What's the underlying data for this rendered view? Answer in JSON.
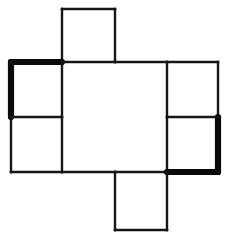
{
  "figure": {
    "background_color": "#ffffff",
    "thin_stick_color": "#161616",
    "bold_stick_color": "#0a0a0a",
    "thin_stick_width": 2.4,
    "bold_stick_width": 6.2,
    "canvas": {
      "width": 234,
      "height": 247
    },
    "grid": {
      "vertical_lines_x": [
        11,
        62,
        115,
        167,
        218
      ],
      "horizontal_lines_y": [
        9,
        62,
        117,
        172,
        230
      ]
    },
    "counts": {
      "total_sticks": 22,
      "bold_sticks": 4,
      "thin_sticks": 18,
      "squares": 6
    },
    "squares": [
      {
        "name": "top-square",
        "x1": 62,
        "y1": 9,
        "x2": 115,
        "y2": 62
      },
      {
        "name": "left-upper-square",
        "x1": 11,
        "y1": 62,
        "x2": 62,
        "y2": 117
      },
      {
        "name": "left-lower-square",
        "x1": 11,
        "y1": 117,
        "x2": 62,
        "y2": 172
      },
      {
        "name": "center-large-square",
        "x1": 62,
        "y1": 62,
        "x2": 167,
        "y2": 172
      },
      {
        "name": "right-upper-square",
        "x1": 167,
        "y1": 62,
        "x2": 218,
        "y2": 117
      },
      {
        "name": "right-lower-square",
        "x1": 167,
        "y1": 117,
        "x2": 218,
        "y2": 172
      },
      {
        "name": "bottom-square",
        "x1": 115,
        "y1": 172,
        "x2": 167,
        "y2": 230
      }
    ],
    "sticks": [
      {
        "name": "top-square-top-edge",
        "weight": "thin",
        "x1": 62,
        "y1": 9,
        "x2": 115,
        "y2": 9
      },
      {
        "name": "top-square-left-edge",
        "weight": "thin",
        "x1": 62,
        "y1": 9,
        "x2": 62,
        "y2": 62
      },
      {
        "name": "top-square-right-edge",
        "weight": "thin",
        "x1": 115,
        "y1": 9,
        "x2": 115,
        "y2": 62
      },
      {
        "name": "left-upper-square-top-edge",
        "weight": "bold",
        "x1": 11,
        "y1": 62,
        "x2": 62,
        "y2": 62
      },
      {
        "name": "left-upper-square-left-edge",
        "weight": "bold",
        "x1": 11,
        "y1": 62,
        "x2": 11,
        "y2": 117
      },
      {
        "name": "left-upper-square-bottom-edge",
        "weight": "thin",
        "x1": 11,
        "y1": 117,
        "x2": 62,
        "y2": 117
      },
      {
        "name": "left-lower-square-left-edge",
        "weight": "thin",
        "x1": 11,
        "y1": 117,
        "x2": 11,
        "y2": 172
      },
      {
        "name": "left-lower-square-bottom-edge",
        "weight": "thin",
        "x1": 11,
        "y1": 172,
        "x2": 62,
        "y2": 172
      },
      {
        "name": "center-square-left-edge-upper",
        "weight": "thin",
        "x1": 62,
        "y1": 62,
        "x2": 62,
        "y2": 117
      },
      {
        "name": "center-square-left-edge-lower",
        "weight": "thin",
        "x1": 62,
        "y1": 117,
        "x2": 62,
        "y2": 172
      },
      {
        "name": "center-square-top-edge-left",
        "weight": "thin",
        "x1": 62,
        "y1": 62,
        "x2": 115,
        "y2": 62
      },
      {
        "name": "center-square-top-edge-right",
        "weight": "thin",
        "x1": 115,
        "y1": 62,
        "x2": 167,
        "y2": 62
      },
      {
        "name": "center-square-bottom-edge-left",
        "weight": "thin",
        "x1": 62,
        "y1": 172,
        "x2": 115,
        "y2": 172
      },
      {
        "name": "center-square-bottom-edge-right",
        "weight": "thin",
        "x1": 115,
        "y1": 172,
        "x2": 167,
        "y2": 172
      },
      {
        "name": "center-square-right-edge-upper",
        "weight": "thin",
        "x1": 167,
        "y1": 62,
        "x2": 167,
        "y2": 117
      },
      {
        "name": "center-square-right-edge-lower",
        "weight": "thin",
        "x1": 167,
        "y1": 117,
        "x2": 167,
        "y2": 172
      },
      {
        "name": "right-upper-square-top-edge",
        "weight": "thin",
        "x1": 167,
        "y1": 62,
        "x2": 218,
        "y2": 62
      },
      {
        "name": "right-upper-square-right-edge",
        "weight": "thin",
        "x1": 218,
        "y1": 62,
        "x2": 218,
        "y2": 117
      },
      {
        "name": "right-lower-square-top-edge",
        "weight": "thin",
        "x1": 167,
        "y1": 117,
        "x2": 218,
        "y2": 117
      },
      {
        "name": "right-lower-square-right-edge",
        "weight": "bold",
        "x1": 218,
        "y1": 117,
        "x2": 218,
        "y2": 172
      },
      {
        "name": "right-lower-square-bottom-edge",
        "weight": "bold",
        "x1": 167,
        "y1": 172,
        "x2": 218,
        "y2": 172
      },
      {
        "name": "bottom-square-left-edge",
        "weight": "thin",
        "x1": 115,
        "y1": 172,
        "x2": 115,
        "y2": 230
      },
      {
        "name": "bottom-square-right-edge",
        "weight": "thin",
        "x1": 167,
        "y1": 172,
        "x2": 167,
        "y2": 230
      },
      {
        "name": "bottom-square-bottom-edge",
        "weight": "thin",
        "x1": 115,
        "y1": 230,
        "x2": 167,
        "y2": 230
      }
    ],
    "joints": [
      {
        "name": "joint-top-left",
        "cx": 62,
        "cy": 9
      },
      {
        "name": "joint-top-right",
        "cx": 115,
        "cy": 9
      },
      {
        "name": "joint-left-outer-top",
        "cx": 11,
        "cy": 62
      },
      {
        "name": "joint-center-top-left",
        "cx": 62,
        "cy": 62
      },
      {
        "name": "joint-center-top-mid",
        "cx": 115,
        "cy": 62
      },
      {
        "name": "joint-center-top-right",
        "cx": 167,
        "cy": 62
      },
      {
        "name": "joint-right-outer-top",
        "cx": 218,
        "cy": 62
      },
      {
        "name": "joint-left-outer-mid",
        "cx": 11,
        "cy": 117
      },
      {
        "name": "joint-center-left-mid",
        "cx": 62,
        "cy": 117
      },
      {
        "name": "joint-center-right-mid",
        "cx": 167,
        "cy": 117
      },
      {
        "name": "joint-right-outer-mid",
        "cx": 218,
        "cy": 117
      },
      {
        "name": "joint-left-outer-bottom",
        "cx": 11,
        "cy": 172
      },
      {
        "name": "joint-center-bottom-left",
        "cx": 62,
        "cy": 172
      },
      {
        "name": "joint-center-bottom-mid",
        "cx": 115,
        "cy": 172
      },
      {
        "name": "joint-center-bottom-right",
        "cx": 167,
        "cy": 172
      },
      {
        "name": "joint-right-outer-bottom",
        "cx": 218,
        "cy": 172
      },
      {
        "name": "joint-bottom-left",
        "cx": 115,
        "cy": 230
      },
      {
        "name": "joint-bottom-right",
        "cx": 167,
        "cy": 230
      }
    ]
  }
}
